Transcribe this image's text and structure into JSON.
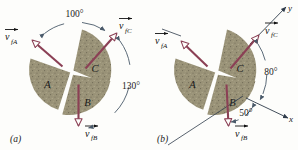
{
  "figure": {
    "type": "physics-vector-diagram",
    "colors": {
      "fragment_fill": "#9a9378",
      "fragment_speckle": "#7d7760",
      "vector": "#8b4055",
      "arc": "#4a5a6a",
      "axis": "#2e3b4a",
      "text": "#1a1a1a",
      "background": "#fdfdfb"
    }
  },
  "panels": [
    {
      "caption": "(a)",
      "fragments": [
        {
          "label": "A"
        },
        {
          "label": "B"
        },
        {
          "label": "C"
        }
      ],
      "vectors": [
        {
          "name": "v-fA",
          "base": "v",
          "sub": "fA"
        },
        {
          "name": "v-fB",
          "base": "v",
          "sub": "fB"
        },
        {
          "name": "v-fC",
          "base": "v",
          "sub": "fC"
        }
      ],
      "angles": [
        {
          "name": "angle-100",
          "value": "100°"
        },
        {
          "name": "angle-130",
          "value": "130°"
        }
      ],
      "axes": []
    },
    {
      "caption": "(b)",
      "fragments": [
        {
          "label": "A"
        },
        {
          "label": "B"
        },
        {
          "label": "C"
        }
      ],
      "vectors": [
        {
          "name": "v-fA",
          "base": "v",
          "sub": "fA"
        },
        {
          "name": "v-fB",
          "base": "v",
          "sub": "fB"
        },
        {
          "name": "v-fC",
          "base": "v",
          "sub": "fC"
        }
      ],
      "angles": [
        {
          "name": "angle-80",
          "value": "80°"
        },
        {
          "name": "angle-50",
          "value": "50°"
        }
      ],
      "axes": [
        {
          "name": "y-axis",
          "label": "y"
        },
        {
          "name": "x-axis",
          "label": "x"
        }
      ]
    }
  ]
}
